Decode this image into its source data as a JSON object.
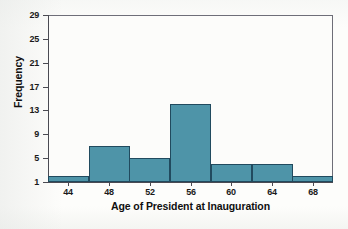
{
  "chart_data": {
    "type": "bar",
    "title": "",
    "subtitle": "",
    "xlabel": "Age of President at Inauguration",
    "ylabel": "Frequency",
    "categories": [
      "42-46",
      "46-50",
      "50-54",
      "54-58",
      "58-62",
      "62-66",
      "66-70"
    ],
    "bin_edges": [
      42,
      46,
      50,
      54,
      58,
      62,
      66,
      70
    ],
    "bin_width": 4,
    "values": [
      2,
      7,
      5,
      14,
      4,
      4,
      2
    ],
    "x_tick_labels": [
      "44",
      "48",
      "52",
      "56",
      "60",
      "64",
      "68"
    ],
    "x_tick_values": [
      44,
      48,
      52,
      56,
      60,
      64,
      68
    ],
    "y_tick_labels": [
      "1",
      "5",
      "9",
      "13",
      "17",
      "21",
      "25",
      "29"
    ],
    "y_tick_values": [
      1,
      5,
      9,
      13,
      17,
      21,
      25,
      29
    ],
    "xlim": [
      42,
      70
    ],
    "ylim": [
      1,
      29
    ],
    "grid": false,
    "legend": null,
    "legend_position": "none",
    "bar_color": "#4e94a8",
    "bar_border_color": "#214a5e",
    "axis_color": "#4a4a52",
    "text_color": "#101010",
    "background_color": "#fcfcfa"
  }
}
